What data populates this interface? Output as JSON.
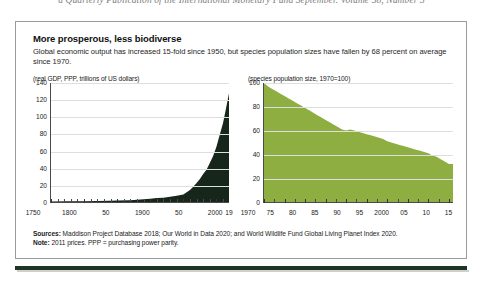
{
  "running_head": "a Quarterly Publication of the International Monetary Fund September. Volume 58, Number 3",
  "figure": {
    "title": "More prosperous, less biodiverse",
    "subtitle": "Global economic output has increased 15-fold since 1950, but species population sizes have fallen by 68 percent on average since 1970.",
    "sources_label": "Sources:",
    "sources_text": " Maddison Project Database 2018; Our World in Data 2020; and World Wildlife Fund Global Living Planet Index 2020.",
    "note_label": "Note:",
    "note_text": " 2011 prices.  PPP = purchasing power parity."
  },
  "colors": {
    "gdp_area": "#16261a",
    "species_area": "#8fae41",
    "axis": "#4a4a4a",
    "grid": "#dedede",
    "rule": "#1f3524"
  },
  "chart_data": [
    {
      "type": "area",
      "id": "gdp",
      "title": "",
      "unit_label": "(real GDP, PPP, trillions of US dollars)",
      "xlabel": "",
      "ylabel": "",
      "xlim": [
        1750,
        2019
      ],
      "ylim": [
        0,
        140
      ],
      "yticks": [
        0,
        20,
        40,
        60,
        80,
        100,
        120,
        140
      ],
      "ytick_labels": [
        "0",
        "20",
        "40",
        "60",
        "80",
        "100",
        "120",
        "140"
      ],
      "xticks": [
        1750,
        1800,
        1850,
        1900,
        1950,
        2000,
        2019
      ],
      "xtick_labels": [
        "1750",
        "1800",
        "50",
        "1900",
        "50",
        "2000",
        "19"
      ],
      "grid": true,
      "legend": "none",
      "x": [
        1750,
        1775,
        1800,
        1820,
        1840,
        1850,
        1870,
        1880,
        1890,
        1900,
        1910,
        1920,
        1930,
        1940,
        1950,
        1955,
        1960,
        1965,
        1970,
        1975,
        1980,
        1985,
        1990,
        1995,
        2000,
        2005,
        2010,
        2015,
        2019
      ],
      "values": [
        0.6,
        0.8,
        1.0,
        1.2,
        1.5,
        1.7,
        2.2,
        2.6,
        3.1,
        3.8,
        4.7,
        5.0,
        6.2,
        7.5,
        8.9,
        11.5,
        14.2,
        18.0,
        22.5,
        27.0,
        33.0,
        38.0,
        46.0,
        54.0,
        65.0,
        79.0,
        93.0,
        112.0,
        128.0
      ]
    },
    {
      "type": "area",
      "id": "species",
      "title": "",
      "unit_label": "(species population size, 1970=100)",
      "xlabel": "",
      "ylabel": "",
      "xlim": [
        1970,
        2016
      ],
      "ylim": [
        0,
        100
      ],
      "yticks": [
        0,
        20,
        40,
        60,
        80,
        100
      ],
      "ytick_labels": [
        "0",
        "20",
        "40",
        "60",
        "80",
        "100"
      ],
      "xticks": [
        1970,
        1975,
        1980,
        1985,
        1990,
        1995,
        2000,
        2005,
        2010,
        2015
      ],
      "xtick_labels": [
        "1970",
        "75",
        "80",
        "85",
        "90",
        "95",
        "2000",
        "05",
        "10",
        "15"
      ],
      "grid": true,
      "legend": "none",
      "x": [
        1970,
        1971,
        1972,
        1973,
        1974,
        1975,
        1976,
        1977,
        1978,
        1979,
        1980,
        1981,
        1982,
        1983,
        1984,
        1985,
        1986,
        1987,
        1988,
        1989,
        1990,
        1991,
        1992,
        1993,
        1994,
        1995,
        1996,
        1997,
        1998,
        1999,
        2000,
        2001,
        2002,
        2003,
        2004,
        2005,
        2006,
        2007,
        2008,
        2009,
        2010,
        2011,
        2012,
        2013,
        2014,
        2015,
        2016
      ],
      "values": [
        100,
        97,
        95,
        93,
        91,
        89,
        87,
        85,
        83,
        81,
        79,
        77,
        75,
        73,
        71,
        69,
        67,
        65,
        63,
        61,
        60,
        61,
        60,
        59,
        58,
        57,
        56,
        55,
        54,
        53,
        51,
        50,
        49,
        48,
        47,
        46,
        45,
        44,
        43,
        42,
        41,
        39,
        38,
        36,
        34,
        32,
        32
      ]
    }
  ]
}
